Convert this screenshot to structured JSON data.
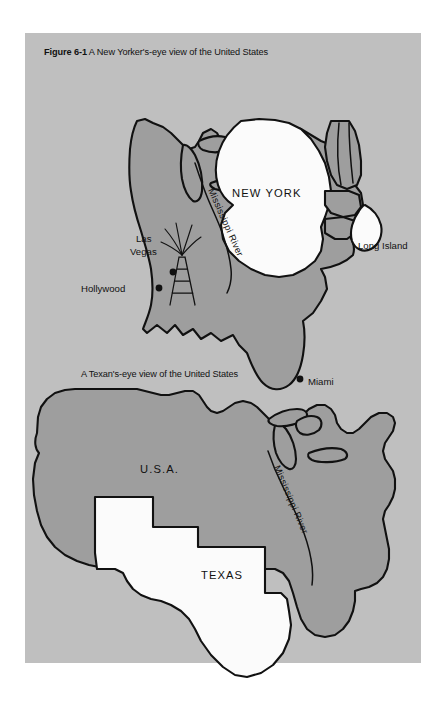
{
  "figure": {
    "number": "Figure 6-1",
    "caption": "A New Yorker's-eye view of the United States",
    "panel_color": "#bfbfbf",
    "page_color": "#ffffff"
  },
  "colors": {
    "land_fill": "#9e9e9e",
    "highlight_fill": "#fbfbfb",
    "outline": "#111111"
  },
  "maps": [
    {
      "id": "new-yorker-view",
      "title": "A New Yorker's-eye view of the United States",
      "highlighted_region": "NEW YORK",
      "labels": {
        "new_york": "NEW YORK",
        "long_island": "Long Island",
        "mississippi_river": "Mississippi River",
        "las_vegas_line1": "Las",
        "las_vegas_line2": "Vegas",
        "hollywood": "Hollywood",
        "miami": "Miami"
      },
      "cities": [
        {
          "name": "Las Vegas",
          "x": 148,
          "y": 239
        },
        {
          "name": "Hollywood",
          "x": 134,
          "y": 255
        },
        {
          "name": "Miami",
          "x": 275,
          "y": 346
        }
      ],
      "features": [
        "oil-derrick",
        "mississippi-river",
        "great-lakes",
        "long-island"
      ]
    },
    {
      "id": "texan-view",
      "title": "A Texan's-eye view of the United States",
      "highlighted_region": "TEXAS",
      "labels": {
        "usa": "U.S.A.",
        "texas": "TEXAS",
        "mississippi_river": "Mississippi River"
      },
      "cities": [],
      "features": [
        "mississippi-river",
        "great-lakes",
        "florida"
      ]
    }
  ]
}
